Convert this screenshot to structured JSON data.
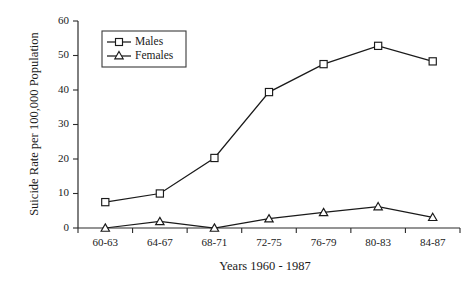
{
  "chart_data": {
    "type": "line",
    "title": "",
    "xlabel": "Years 1960 - 1987",
    "ylabel": "Suicide Rate per 100,000 Population",
    "categories": [
      "60-63",
      "64-67",
      "68-71",
      "72-75",
      "76-79",
      "80-83",
      "84-87"
    ],
    "yticks": [
      0,
      10,
      20,
      30,
      40,
      50,
      60
    ],
    "ylim": [
      0,
      60
    ],
    "grid": false,
    "legend_position": "upper-left",
    "series": [
      {
        "name": "Males",
        "marker": "open-square",
        "values": [
          7.5,
          10.0,
          20.3,
          39.4,
          47.5,
          52.8,
          48.3
        ]
      },
      {
        "name": "Females",
        "marker": "open-triangle",
        "values": [
          0.0,
          1.9,
          0.0,
          2.7,
          4.5,
          6.2,
          3.1
        ]
      }
    ],
    "colors": {
      "line": "#1a1a1a",
      "axis": "#2b2b2b",
      "background": "#ffffff"
    }
  }
}
